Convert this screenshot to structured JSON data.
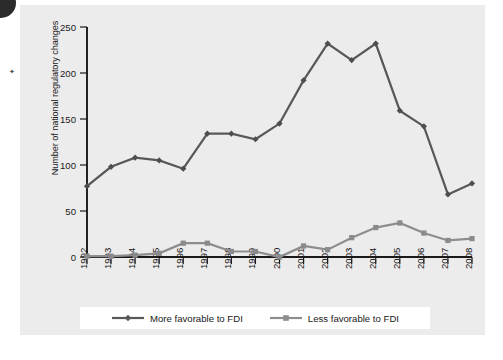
{
  "figure": {
    "background_color": "#ececec",
    "panel_color": "#ececec"
  },
  "legend": {
    "position": "bottom-center",
    "entries": [
      {
        "label": "More favorable to FDI",
        "color": "#58585a",
        "marker": "diamond-marker"
      },
      {
        "label": "Less favorable to FDI",
        "color": "#8d8d8f",
        "marker": "square-marker"
      }
    ]
  },
  "axes": {
    "y_title": "Number of national regulatory changes",
    "y_ticks": [
      "0",
      "50",
      "100",
      "150",
      "200",
      "250"
    ],
    "x_ticks": [
      "1992",
      "1993",
      "1994",
      "1995",
      "1996",
      "1997",
      "1998",
      "1999",
      "2000",
      "2001",
      "2002",
      "2003",
      "2004",
      "2005",
      "2006",
      "2007",
      "2008"
    ]
  },
  "chart_data": {
    "type": "line",
    "title": "",
    "xlabel": "",
    "ylabel": "Number of national regulatory changes",
    "ylim": [
      0,
      250
    ],
    "ytick_step": 50,
    "grid": false,
    "legend_position": "bottom-center",
    "x": [
      "1992",
      "1993",
      "1994",
      "1995",
      "1996",
      "1997",
      "1998",
      "1999",
      "2000",
      "2001",
      "2002",
      "2003",
      "2004",
      "2005",
      "2006",
      "2007",
      "2008"
    ],
    "categories": [
      "1992",
      "1993",
      "1994",
      "1995",
      "1996",
      "1997",
      "1998",
      "1999",
      "2000",
      "2001",
      "2002",
      "2003",
      "2004",
      "2005",
      "2006",
      "2007",
      "2008"
    ],
    "series": [
      {
        "name": "More favorable to FDI",
        "color": "#58585a",
        "marker": "diamond",
        "values": [
          77,
          98,
          108,
          105,
          96,
          134,
          134,
          128,
          145,
          192,
          232,
          214,
          232,
          159,
          142,
          68,
          80
        ]
      },
      {
        "name": "Less favorable to FDI",
        "color": "#8d8d8f",
        "marker": "square",
        "values": [
          1,
          1,
          2,
          4,
          15,
          15,
          6,
          6,
          0,
          12,
          8,
          21,
          32,
          37,
          26,
          18,
          20
        ]
      }
    ]
  }
}
